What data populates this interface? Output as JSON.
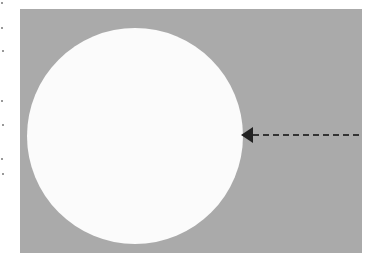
{
  "figure": {
    "background_color": "#aaaaaa",
    "disc": {
      "color": "#fbfbfb",
      "center_x": 135,
      "center_y": 136,
      "radius": 108
    },
    "arrow": {
      "color": "#222222",
      "direction": "left",
      "style": "dashed",
      "tip_x": 241,
      "tip_y": 135,
      "tail_x": 362
    }
  }
}
